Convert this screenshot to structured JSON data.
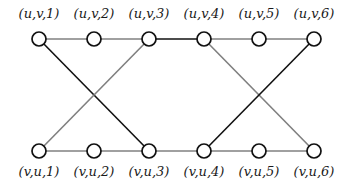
{
  "diagram": {
    "colors": {
      "dark": "#111111",
      "light": "#808080",
      "node_stroke": "#111111",
      "node_fill": "#ffffff"
    },
    "top_nodes": [
      {
        "id": "uv1",
        "label": "(u,v,1)",
        "x": 39,
        "y": 39
      },
      {
        "id": "uv2",
        "label": "(u,v,2)",
        "x": 94,
        "y": 39
      },
      {
        "id": "uv3",
        "label": "(u,v,3)",
        "x": 149,
        "y": 39
      },
      {
        "id": "uv4",
        "label": "(u,v,4)",
        "x": 204,
        "y": 39
      },
      {
        "id": "uv5",
        "label": "(u,v,5)",
        "x": 259,
        "y": 39
      },
      {
        "id": "uv6",
        "label": "(u,v,6)",
        "x": 314,
        "y": 39
      }
    ],
    "bottom_nodes": [
      {
        "id": "vu1",
        "label": "(v,u,1)",
        "x": 39,
        "y": 151
      },
      {
        "id": "vu2",
        "label": "(v,u,2)",
        "x": 94,
        "y": 151
      },
      {
        "id": "vu3",
        "label": "(v,u,3)",
        "x": 149,
        "y": 151
      },
      {
        "id": "vu4",
        "label": "(v,u,4)",
        "x": 204,
        "y": 151
      },
      {
        "id": "vu5",
        "label": "(v,u,5)",
        "x": 259,
        "y": 151
      },
      {
        "id": "vu6",
        "label": "(v,u,6)",
        "x": 314,
        "y": 151
      }
    ],
    "edges": [
      {
        "from": "uv1",
        "to": "uv2",
        "style": "light"
      },
      {
        "from": "uv2",
        "to": "uv3",
        "style": "light"
      },
      {
        "from": "uv3",
        "to": "uv4",
        "style": "dark"
      },
      {
        "from": "uv4",
        "to": "uv5",
        "style": "light"
      },
      {
        "from": "uv5",
        "to": "uv6",
        "style": "light"
      },
      {
        "from": "vu1",
        "to": "vu2",
        "style": "light"
      },
      {
        "from": "vu2",
        "to": "vu3",
        "style": "light"
      },
      {
        "from": "vu3",
        "to": "vu4",
        "style": "light"
      },
      {
        "from": "vu4",
        "to": "vu5",
        "style": "light"
      },
      {
        "from": "vu5",
        "to": "vu6",
        "style": "light"
      },
      {
        "from": "uv1",
        "to": "vu3",
        "style": "dark"
      },
      {
        "from": "vu1",
        "to": "uv3",
        "style": "light"
      },
      {
        "from": "uv4",
        "to": "vu6",
        "style": "light"
      },
      {
        "from": "vu4",
        "to": "uv6",
        "style": "dark"
      }
    ]
  }
}
